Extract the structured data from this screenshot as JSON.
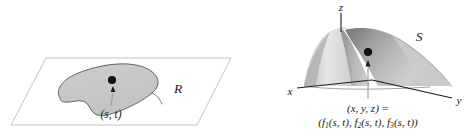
{
  "figure": {
    "type": "math-diagram",
    "colors": {
      "ink": "#1a1a1a",
      "plane_outline": "#b9b9b9",
      "region_fill": "#c9c9c9",
      "region_outline": "#4d4d4d",
      "surface_light": "#e3e3e3",
      "surface_mid": "#bdbdbd",
      "surface_dark": "#8f8f8f",
      "leader_line": "#9a9a9a",
      "background": "#ffffff"
    }
  },
  "left_panel": {
    "name": "domain-plane",
    "region_label": "R",
    "point_label": "(s, t)"
  },
  "right_panel": {
    "name": "surface-space",
    "surface_label": "S",
    "axes": {
      "x": "x",
      "y": "y",
      "z": "z"
    },
    "formula": {
      "line1": "(x, y, z) =",
      "line2_parts": [
        {
          "open": "(",
          "fn": "f",
          "sub": "1",
          "args": "(s, t),"
        },
        {
          "open": " ",
          "fn": "f",
          "sub": "2",
          "args": "(s, t),"
        },
        {
          "open": " ",
          "fn": "f",
          "sub": "3",
          "args": "(s, t))"
        }
      ],
      "line2_plain": "(f1(s, t), f2(s, t), f3(s, t))"
    }
  }
}
